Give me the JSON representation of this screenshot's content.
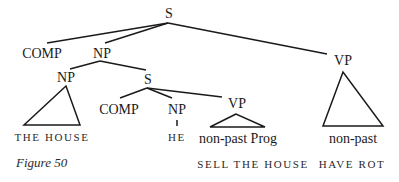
{
  "figure": {
    "caption": "Figure 50",
    "nodes": {
      "root": "S",
      "comp_top": "COMP",
      "np_top": "NP",
      "vp_right": "VP",
      "np_left": "NP",
      "s_embedded": "S",
      "comp_mid": "COMP",
      "np_mid": "NP",
      "vp_mid": "VP"
    },
    "leaves": {
      "np_left": "THE HOUSE",
      "np_mid": "HE",
      "vp_mid": "non-past Prog",
      "vp_right": "non-past"
    },
    "glosses": {
      "vp_mid": "SELL THE HOUSE",
      "vp_right": "HAVE ROT"
    }
  }
}
